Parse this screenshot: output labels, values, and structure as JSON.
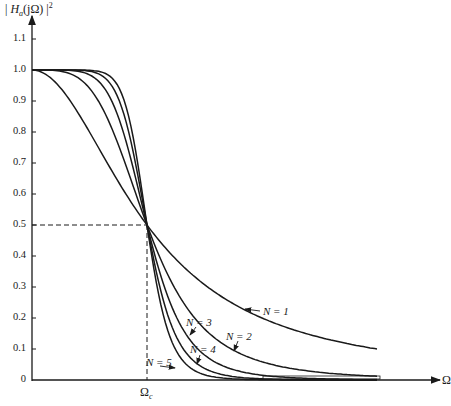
{
  "chart_data": {
    "type": "line",
    "title": "",
    "ylabel": "|H_a(jΩ)|²",
    "xlabel": "Ω",
    "x_tick_labels": [
      "Ωc"
    ],
    "ylim": [
      0,
      1.1
    ],
    "yticks": [
      0,
      0.1,
      0.2,
      0.3,
      0.4,
      0.5,
      0.6,
      0.7,
      0.8,
      0.9,
      1.0,
      1.1
    ],
    "ytick_labels": [
      "0",
      "0.1",
      "0.2",
      "0.3",
      "0.4",
      "0.5",
      "0.6",
      "0.7",
      "0.8",
      "0.9",
      "1.0",
      "1.1"
    ],
    "grid": false,
    "legend": "none (inline annotations)",
    "reference_line": {
      "x": 1.0,
      "y": 0.5,
      "style": "dashed"
    },
    "x": [
      0,
      0.25,
      0.5,
      0.75,
      1.0,
      1.25,
      1.5,
      1.75,
      2.0,
      2.25,
      2.5,
      2.75,
      3.0
    ],
    "x_units": "Ω/Ωc",
    "series": [
      {
        "name": "N = 1",
        "values": [
          1.0,
          0.941,
          0.8,
          0.64,
          0.5,
          0.39,
          0.308,
          0.246,
          0.2,
          0.165,
          0.138,
          0.117,
          0.1
        ]
      },
      {
        "name": "N = 2",
        "values": [
          1.0,
          0.996,
          0.941,
          0.76,
          0.5,
          0.291,
          0.165,
          0.089,
          0.059,
          0.039,
          0.025,
          0.017,
          0.012
        ]
      },
      {
        "name": "N = 3",
        "values": [
          1.0,
          1.0,
          0.985,
          0.849,
          0.5,
          0.208,
          0.081,
          0.035,
          0.015,
          0.008,
          0.004,
          0.002,
          0.001
        ]
      },
      {
        "name": "N = 4",
        "values": [
          1.0,
          1.0,
          0.996,
          0.909,
          0.5,
          0.144,
          0.038,
          0.011,
          0.004,
          0.002,
          0.001,
          0.0,
          0.0
        ]
      },
      {
        "name": "N = 5",
        "values": [
          1.0,
          1.0,
          0.999,
          0.947,
          0.5,
          0.097,
          0.017,
          0.004,
          0.001,
          0.0,
          0.0,
          0.0,
          0.0
        ]
      }
    ],
    "annotations": [
      {
        "text": "N = 1",
        "x": 263,
        "y": 306,
        "arrow": "left"
      },
      {
        "text": "N = 2",
        "x": 226,
        "y": 331,
        "arrow": "down-left"
      },
      {
        "text": "N = 3",
        "x": 186,
        "y": 317,
        "arrow": "down-left"
      },
      {
        "text": "N = 4",
        "x": 190,
        "y": 344,
        "arrow": "down-left"
      },
      {
        "text": "N = 5",
        "x": 151,
        "y": 357,
        "arrow": "right"
      }
    ]
  },
  "axes": {
    "y_title_prefix": "|",
    "y_title_H": "H",
    "y_title_sub": "a",
    "y_title_arg": "(jΩ)",
    "y_title_suffix": "|",
    "y_title_sup": "2",
    "x_title": "Ω",
    "x_marker": "Ω",
    "x_marker_sub": "c"
  },
  "labels": {
    "n1": "N = 1",
    "n2": "N = 2",
    "n3": "N = 3",
    "n4": "N = 4",
    "n5": "N = 5"
  }
}
